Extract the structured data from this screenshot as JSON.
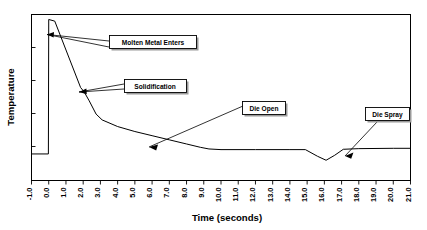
{
  "chart_data": {
    "type": "line",
    "title": "",
    "xlabel": "Time (seconds)",
    "ylabel": "Temperature",
    "xlim": [
      -1.0,
      21.0
    ],
    "ylim": [
      0,
      100
    ],
    "grid": false,
    "legend": "none",
    "xticks": [
      "-1.0",
      "0.0",
      "1.0",
      "2.0",
      "3.0",
      "4.0",
      "5.0",
      "6.0",
      "7.0",
      "8.0",
      "9.0",
      "10.0",
      "11.0",
      "12.0",
      "13.0",
      "14.0",
      "15.0",
      "16.0",
      "17.0",
      "18.0",
      "19.0",
      "20.0",
      "21.0"
    ],
    "yticks": [],
    "ytick_labels_shown": false,
    "series": [
      {
        "name": "Die temperature",
        "x": [
          -1.0,
          -0.02,
          0.0,
          0.35,
          1.85,
          2.05,
          2.35,
          2.75,
          3.1,
          4.0,
          5.0,
          6.0,
          7.0,
          8.0,
          8.8,
          9.3,
          10.0,
          12.0,
          14.0,
          14.9,
          15.6,
          16.1,
          16.6,
          17.1,
          18.0,
          20.0,
          21.0
        ],
        "y": [
          16.0,
          16.0,
          97.0,
          96.0,
          56.0,
          53.5,
          48.0,
          40.0,
          36.5,
          32.5,
          29.5,
          27.0,
          24.5,
          22.0,
          20.0,
          19.0,
          18.6,
          18.6,
          18.6,
          18.6,
          14.6,
          12.2,
          15.2,
          18.8,
          19.2,
          19.4,
          19.4
        ]
      }
    ],
    "annotations": [
      {
        "id": "molten-metal-enters",
        "label": "Molten Metal Enters",
        "target_x": 0.0,
        "target_y": 97.0
      },
      {
        "id": "solidification",
        "label": "Solidification",
        "target_x": 2.05,
        "target_y": 53.5
      },
      {
        "id": "die-open",
        "label": "Die Open",
        "target_x": 7.4,
        "target_y": 23.4
      },
      {
        "id": "die-spray",
        "label": "Die Spray",
        "target_x": 16.2,
        "target_y": 14.6
      }
    ]
  }
}
